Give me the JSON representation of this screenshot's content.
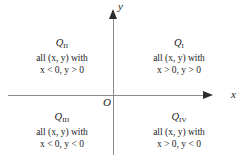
{
  "figure": {
    "background_color": "#ffffff",
    "axis_color": "#8a8a8a",
    "arrow_color": "#2b2b2b",
    "text_color": "#1a1a1a"
  },
  "axes": {
    "x_label": "x",
    "y_label": "y",
    "origin_label": "O"
  },
  "quadrants": [
    {
      "id": "q1",
      "name": "Q",
      "subscript": "I",
      "condition_line1": "all (x, y) with",
      "condition_line2": "x > 0, y > 0"
    },
    {
      "id": "q2",
      "name": "Q",
      "subscript": "II",
      "condition_line1": "all (x, y) with",
      "condition_line2": "x < 0, y > 0"
    },
    {
      "id": "q3",
      "name": "Q",
      "subscript": "III",
      "condition_line1": "all (x, y) with",
      "condition_line2": "x < 0, y < 0"
    },
    {
      "id": "q4",
      "name": "Q",
      "subscript": "IV",
      "condition_line1": "all (x, y) with",
      "condition_line2": "x > 0, y < 0"
    }
  ],
  "chart_data": {
    "type": "diagram",
    "xlabel": "x",
    "ylabel": "y",
    "origin": "O",
    "regions": [
      {
        "label": "Q I",
        "x_sign": "positive",
        "y_sign": "positive",
        "description": "all (x, y) with x > 0, y > 0",
        "position": "upper-right"
      },
      {
        "label": "Q II",
        "x_sign": "negative",
        "y_sign": "positive",
        "description": "all (x, y) with x < 0, y > 0",
        "position": "upper-left"
      },
      {
        "label": "Q III",
        "x_sign": "negative",
        "y_sign": "negative",
        "description": "all (x, y) with x < 0, y < 0",
        "position": "lower-left"
      },
      {
        "label": "Q IV",
        "x_sign": "positive",
        "y_sign": "negative",
        "description": "all (x, y) with x > 0, y < 0",
        "position": "lower-right"
      }
    ],
    "grid": false,
    "legend": false
  }
}
